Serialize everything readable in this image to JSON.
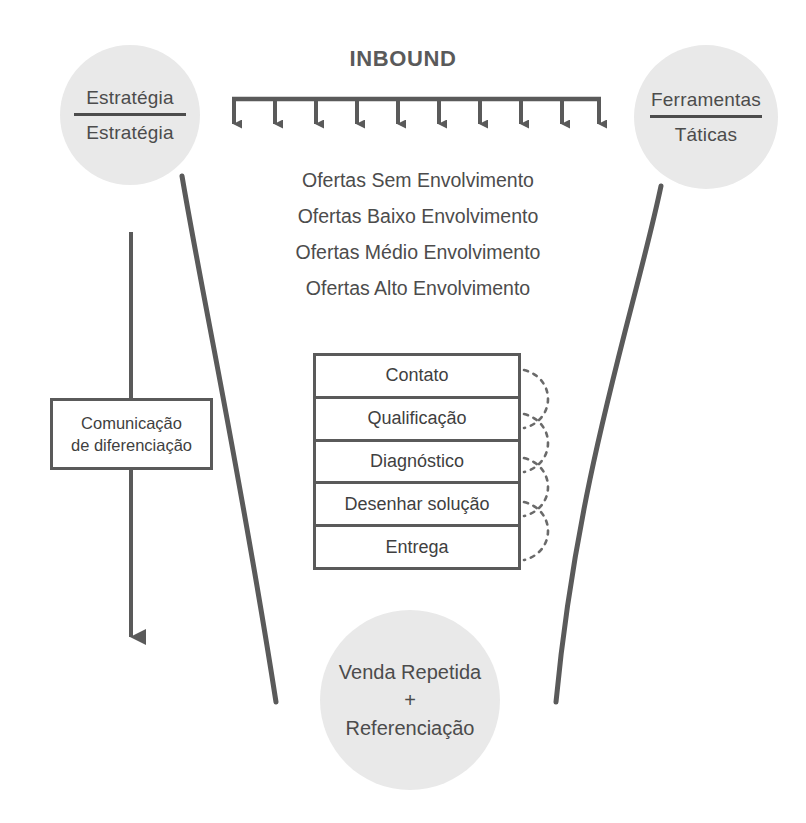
{
  "diagram": {
    "title": "INBOUND",
    "colors": {
      "circle_fill": "#e9e9e9",
      "line": "#5a5a5a",
      "text": "#4c4c4c",
      "background": "#ffffff"
    },
    "inbound_arrow_count": 10
  },
  "strategy_circle": {
    "top_label": "Estratégia",
    "bottom_label": "Estratégia"
  },
  "tools_circle": {
    "top_label": "Ferramentas",
    "bottom_label": "Táticas"
  },
  "repeat_circle": {
    "line1": "Venda Repetida",
    "line2": "+",
    "line3": "Referenciação"
  },
  "offers": [
    "Ofertas Sem Envolvimento",
    "Ofertas Baixo Envolvimento",
    "Ofertas Médio Envolvimento",
    "Ofertas Alto Envolvimento"
  ],
  "process_stack": {
    "steps": [
      "Contato",
      "Qualificação",
      "Diagnóstico",
      "Desenhar solução",
      "Entrega"
    ]
  },
  "differentiation_box": {
    "line1": "Comunicação",
    "line2": "de diferenciação"
  }
}
